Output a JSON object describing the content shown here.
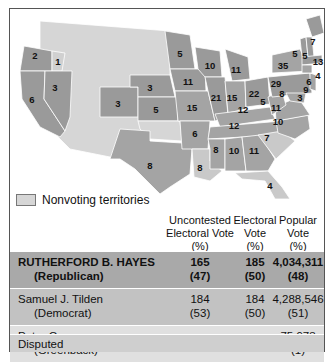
{
  "colors": {
    "republican": "#9a9a9a",
    "democrat": "#a4a4a4",
    "disputed": "#c9c9c9",
    "nonvoting": "#d6d6d6",
    "hayes_row": "#a9a9a9",
    "tilden_row": "#c2c2c2",
    "cooper_row": "#e0e0e0",
    "disputed_row": "#cfcfcf"
  },
  "legend": {
    "swatch_label": "Nonvoting territories"
  },
  "table": {
    "headers": {
      "uncontested": [
        "Uncontested",
        "Electoral Vote",
        "(%)"
      ],
      "electoral": [
        "Electoral",
        "Vote",
        "(%)"
      ],
      "popular": [
        "Popular",
        "Vote",
        "(%)"
      ]
    },
    "rows": [
      {
        "name": "RUTHERFORD B. HAYES",
        "party": "(Republican)",
        "uncontested": "165",
        "uncontested_pct": "(47)",
        "electoral": "185",
        "electoral_pct": "(50)",
        "popular": "4,034,311",
        "popular_pct": "(48)"
      },
      {
        "name": "Samuel J. Tilden",
        "party": "(Democrat)",
        "uncontested": "184",
        "uncontested_pct": "(53)",
        "electoral": "184",
        "electoral_pct": "(50)",
        "popular": "4,288,546",
        "popular_pct": "(51)"
      },
      {
        "name": "Peter Cooper",
        "party": "(Greenback)",
        "uncontested": "–",
        "uncontested_pct": "",
        "electoral": "–",
        "electoral_pct": "",
        "popular": "75,973",
        "popular_pct": "(1)"
      }
    ],
    "disputed_label": "Disputed"
  },
  "map": {
    "state_labels": [
      {
        "state": "OR",
        "votes": "2"
      },
      {
        "state": "NV",
        "votes": "3"
      },
      {
        "state": "CA",
        "votes": "6"
      },
      {
        "state": "CO",
        "votes": "3"
      },
      {
        "state": "NE",
        "votes": "3"
      },
      {
        "state": "KS",
        "votes": "5"
      },
      {
        "state": "TX",
        "votes": "8"
      },
      {
        "state": "MN",
        "votes": "5"
      },
      {
        "state": "IA",
        "votes": "11"
      },
      {
        "state": "MO",
        "votes": "15"
      },
      {
        "state": "AR",
        "votes": "6"
      },
      {
        "state": "LA",
        "votes": "8"
      },
      {
        "state": "WI",
        "votes": "10"
      },
      {
        "state": "IL",
        "votes": "21"
      },
      {
        "state": "MI",
        "votes": "11"
      },
      {
        "state": "IN",
        "votes": "15"
      },
      {
        "state": "OH",
        "votes": "22"
      },
      {
        "state": "KY",
        "votes": "12"
      },
      {
        "state": "TN",
        "votes": "12"
      },
      {
        "state": "MS",
        "votes": "8"
      },
      {
        "state": "AL",
        "votes": "10"
      },
      {
        "state": "GA",
        "votes": "11"
      },
      {
        "state": "FL",
        "votes": "4"
      },
      {
        "state": "SC",
        "votes": "7"
      },
      {
        "state": "NC",
        "votes": "10"
      },
      {
        "state": "VA",
        "votes": "11"
      },
      {
        "state": "WV",
        "votes": "5"
      },
      {
        "state": "PA",
        "votes": "29"
      },
      {
        "state": "NY",
        "votes": "35"
      },
      {
        "state": "MD",
        "votes": "8"
      },
      {
        "state": "DE",
        "votes": "3"
      },
      {
        "state": "NJ",
        "votes": "9"
      },
      {
        "state": "CT",
        "votes": "6"
      },
      {
        "state": "RI",
        "votes": "4"
      },
      {
        "state": "MA",
        "votes": "13"
      },
      {
        "state": "VT",
        "votes": "5"
      },
      {
        "state": "NH",
        "votes": "5"
      },
      {
        "state": "ME",
        "votes": "7"
      },
      {
        "state": "OR-disputed",
        "votes": "1"
      }
    ]
  }
}
